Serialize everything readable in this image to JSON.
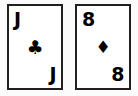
{
  "scene": {
    "title": "Two playing cards",
    "background_color": "#fbfbfb",
    "ink_color": "#000000",
    "card_face_color": "#ffffff",
    "card_border_color": "#231f20"
  },
  "cards": [
    {
      "name": "jack-of-clubs",
      "rank": "J",
      "suit": "clubs",
      "suit_symbol": "♣",
      "suit_color": "#000000",
      "corner_top_left": "J",
      "corner_bottom_right": "J",
      "center_pip": "♣"
    },
    {
      "name": "eight-of-diamonds",
      "rank": "8",
      "suit": "diamonds",
      "suit_symbol": "♦",
      "suit_color": "#000000",
      "corner_top_left": "8",
      "corner_bottom_right": "8",
      "center_pip": "♦"
    }
  ]
}
